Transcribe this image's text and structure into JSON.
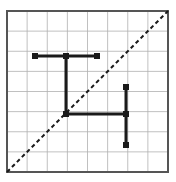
{
  "figure": {
    "title": "",
    "type": "grid-diagram",
    "canvas": {
      "width": 176,
      "height": 182
    },
    "plot_area": {
      "x0": 7,
      "y0": 11,
      "x1": 168,
      "y1": 172
    },
    "grid": {
      "visible": true,
      "columns": 8,
      "rows": 8,
      "cell_width": 20.125,
      "cell_height": 20.125,
      "line_color": "#b0b0b0",
      "line_width": 0.8,
      "border_color": "#555555",
      "border_width": 2
    },
    "diagonal": {
      "label": "dashed-diagonal",
      "style": "dashed",
      "color": "#1a1a1a",
      "width": 2,
      "dash_pattern": "4 3",
      "from": {
        "x": 7,
        "y": 172
      },
      "to": {
        "x": 168,
        "y": 11
      }
    },
    "polylines": [
      {
        "label": "upper-tee-shape",
        "color": "#1a1a1a",
        "width": 3,
        "segments": [
          {
            "from": {
              "x": 35,
              "y": 56
            },
            "to": {
              "x": 97,
              "y": 56
            }
          },
          {
            "from": {
              "x": 66,
              "y": 56
            },
            "to": {
              "x": 66,
              "y": 114
            }
          }
        ]
      },
      {
        "label": "lower-corner-shape",
        "color": "#1a1a1a",
        "width": 3,
        "segments": [
          {
            "from": {
              "x": 66,
              "y": 114
            },
            "to": {
              "x": 126,
              "y": 114
            }
          },
          {
            "from": {
              "x": 126,
              "y": 87
            },
            "to": {
              "x": 126,
              "y": 145
            }
          }
        ]
      }
    ],
    "endpoint_dots": [
      {
        "label": "dot-upper-left",
        "x": 35,
        "y": 56,
        "r": 3
      },
      {
        "label": "dot-upper-mid",
        "x": 66,
        "y": 56,
        "r": 3
      },
      {
        "label": "dot-upper-right",
        "x": 97,
        "y": 56,
        "r": 3
      },
      {
        "label": "dot-corner-junction",
        "x": 66,
        "y": 114,
        "r": 3
      },
      {
        "label": "dot-right-junction",
        "x": 126,
        "y": 114,
        "r": 3
      },
      {
        "label": "dot-right-top",
        "x": 126,
        "y": 87,
        "r": 3
      },
      {
        "label": "dot-right-bottom",
        "x": 126,
        "y": 145,
        "r": 3
      }
    ],
    "colors": {
      "background": "#ffffff",
      "stroke": "#1a1a1a",
      "grid": "#b0b0b0",
      "border": "#555555"
    }
  },
  "chart_data": {
    "type": "line",
    "title": "",
    "subtitle": "",
    "xlabel": "",
    "ylabel": "",
    "xlim": [
      0,
      8
    ],
    "ylim": [
      0,
      8
    ],
    "grid": true,
    "legend": "none",
    "tick_labels_x": [],
    "tick_labels_y": [],
    "annotations": [],
    "series": [
      {
        "name": "identity-line",
        "style": "dashed",
        "x": [
          0,
          8
        ],
        "y": [
          0,
          8
        ]
      },
      {
        "name": "upper-tee-shape",
        "style": "solid",
        "points": [
          {
            "x": 1.4,
            "y": 5.75
          },
          {
            "x": 4.45,
            "y": 5.75
          },
          {
            "x": 2.95,
            "y": 5.75
          },
          {
            "x": 2.95,
            "y": 2.9
          }
        ]
      },
      {
        "name": "lower-corner-shape",
        "style": "solid",
        "points": [
          {
            "x": 2.95,
            "y": 2.9
          },
          {
            "x": 5.9,
            "y": 2.9
          },
          {
            "x": 5.9,
            "y": 4.25
          },
          {
            "x": 5.9,
            "y": 1.35
          }
        ]
      }
    ]
  }
}
